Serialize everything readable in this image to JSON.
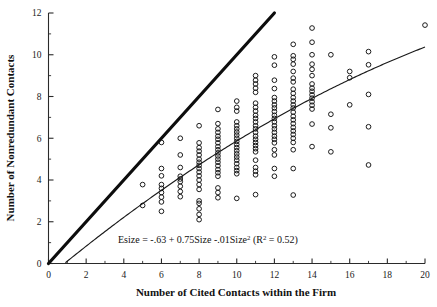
{
  "chart_data": {
    "type": "scatter",
    "title": "",
    "xlabel": "Number of Cited Contacts within the Firm",
    "ylabel": "Number of Nonredundant Contacts",
    "xlim": [
      0,
      20
    ],
    "ylim": [
      0,
      12
    ],
    "x_ticks": [
      0,
      2,
      4,
      6,
      8,
      10,
      12,
      14,
      16,
      18,
      20
    ],
    "y_ticks": [
      0,
      2,
      4,
      6,
      8,
      10,
      12
    ],
    "x_minor_ticks": [
      1,
      3,
      5,
      7,
      9,
      11,
      13,
      15,
      17,
      19
    ],
    "y_minor_ticks": [
      1,
      3,
      5,
      7,
      9,
      11
    ],
    "grid": false,
    "legend": "none",
    "annotation": "Esize =  -.63 + 0.75Size -.01Size²   (R² = 0.52)",
    "annotation_parts": {
      "lead": "Esize =  -.63 + 0.75Size -.01Size",
      "sup1": "2",
      "mid": "   (R",
      "sup2": "2",
      "tail": " = 0.52)"
    },
    "marker": "open-circle",
    "reference_line": {
      "name": "y = x identity line",
      "x": [
        0,
        12
      ],
      "y": [
        0,
        12
      ],
      "style": "thick-solid"
    },
    "fit_curve": {
      "name": "Esize = -.63 + 0.75*Size - .01*Size^2",
      "intercept": -0.63,
      "linear_coef": 0.75,
      "quadratic_coef": -0.01,
      "r_squared": 0.52,
      "x_start": 0.9,
      "x_end": 20,
      "style": "thin-solid"
    },
    "points": [
      [
        5,
        2.78
      ],
      [
        5,
        3.78
      ],
      [
        6,
        2.5
      ],
      [
        6,
        2.95
      ],
      [
        6,
        3.18
      ],
      [
        6,
        3.4
      ],
      [
        6,
        3.6
      ],
      [
        6,
        3.78
      ],
      [
        6,
        4.2
      ],
      [
        6,
        4.55
      ],
      [
        6,
        5.8
      ],
      [
        7,
        3.2
      ],
      [
        7,
        3.45
      ],
      [
        7,
        3.7
      ],
      [
        7,
        3.92
      ],
      [
        7,
        4.05
      ],
      [
        7,
        4.18
      ],
      [
        7,
        4.6
      ],
      [
        7,
        5.2
      ],
      [
        7,
        6.0
      ],
      [
        8,
        2.1
      ],
      [
        8,
        2.35
      ],
      [
        8,
        2.62
      ],
      [
        8,
        2.88
      ],
      [
        8,
        3.0
      ],
      [
        8,
        3.55
      ],
      [
        8,
        3.78
      ],
      [
        8,
        4.0
      ],
      [
        8,
        4.2
      ],
      [
        8,
        4.38
      ],
      [
        8,
        4.55
      ],
      [
        8,
        4.7
      ],
      [
        8,
        4.85
      ],
      [
        8,
        5.0
      ],
      [
        8,
        5.2
      ],
      [
        8,
        5.38
      ],
      [
        8,
        5.55
      ],
      [
        8,
        5.78
      ],
      [
        8,
        6.6
      ],
      [
        9,
        3.15
      ],
      [
        9,
        3.4
      ],
      [
        9,
        3.62
      ],
      [
        9,
        4.18
      ],
      [
        9,
        4.35
      ],
      [
        9,
        4.5
      ],
      [
        9,
        4.68
      ],
      [
        9,
        4.85
      ],
      [
        9,
        5.0
      ],
      [
        9,
        5.15
      ],
      [
        9,
        5.3
      ],
      [
        9,
        5.45
      ],
      [
        9,
        5.6
      ],
      [
        9,
        5.78
      ],
      [
        9,
        5.95
      ],
      [
        9,
        6.1
      ],
      [
        9,
        6.28
      ],
      [
        9,
        6.45
      ],
      [
        9,
        6.7
      ],
      [
        9,
        7.38
      ],
      [
        10,
        3.12
      ],
      [
        10,
        4.3
      ],
      [
        10,
        4.45
      ],
      [
        10,
        4.6
      ],
      [
        10,
        4.78
      ],
      [
        10,
        4.95
      ],
      [
        10,
        5.1
      ],
      [
        10,
        5.25
      ],
      [
        10,
        5.4
      ],
      [
        10,
        5.55
      ],
      [
        10,
        5.7
      ],
      [
        10,
        5.85
      ],
      [
        10,
        6.0
      ],
      [
        10,
        6.15
      ],
      [
        10,
        6.3
      ],
      [
        10,
        6.45
      ],
      [
        10,
        6.6
      ],
      [
        10,
        6.78
      ],
      [
        10,
        7.3
      ],
      [
        10,
        7.48
      ],
      [
        10,
        7.78
      ],
      [
        11,
        3.3
      ],
      [
        11,
        4.25
      ],
      [
        11,
        4.42
      ],
      [
        11,
        4.6
      ],
      [
        11,
        4.95
      ],
      [
        11,
        5.35
      ],
      [
        11,
        5.5
      ],
      [
        11,
        5.65
      ],
      [
        11,
        5.8
      ],
      [
        11,
        5.95
      ],
      [
        11,
        6.1
      ],
      [
        11,
        6.28
      ],
      [
        11,
        6.45
      ],
      [
        11,
        6.6
      ],
      [
        11,
        6.78
      ],
      [
        11,
        6.95
      ],
      [
        11,
        7.1
      ],
      [
        11,
        7.3
      ],
      [
        11,
        7.48
      ],
      [
        11,
        7.68
      ],
      [
        11,
        8.2
      ],
      [
        11,
        8.4
      ],
      [
        11,
        8.6
      ],
      [
        11,
        8.78
      ],
      [
        11,
        9.0
      ],
      [
        12,
        4.18
      ],
      [
        12,
        4.55
      ],
      [
        12,
        5.2
      ],
      [
        12,
        5.45
      ],
      [
        12,
        5.78
      ],
      [
        12,
        5.95
      ],
      [
        12,
        6.1
      ],
      [
        12,
        6.28
      ],
      [
        12,
        6.45
      ],
      [
        12,
        6.6
      ],
      [
        12,
        6.78
      ],
      [
        12,
        6.95
      ],
      [
        12,
        7.1
      ],
      [
        12,
        7.28
      ],
      [
        12,
        7.45
      ],
      [
        12,
        7.6
      ],
      [
        12,
        7.78
      ],
      [
        12,
        7.95
      ],
      [
        12,
        8.38
      ],
      [
        12,
        8.78
      ],
      [
        12,
        9.5
      ],
      [
        12,
        9.9
      ],
      [
        13,
        3.28
      ],
      [
        13,
        4.55
      ],
      [
        13,
        5.45
      ],
      [
        13,
        5.8
      ],
      [
        13,
        6.0
      ],
      [
        13,
        6.18
      ],
      [
        13,
        6.35
      ],
      [
        13,
        6.52
      ],
      [
        13,
        6.7
      ],
      [
        13,
        6.88
      ],
      [
        13,
        7.05
      ],
      [
        13,
        7.25
      ],
      [
        13,
        7.45
      ],
      [
        13,
        7.6
      ],
      [
        13,
        7.78
      ],
      [
        13,
        7.95
      ],
      [
        13,
        8.15
      ],
      [
        13,
        8.35
      ],
      [
        13,
        8.7
      ],
      [
        13,
        8.88
      ],
      [
        13,
        9.2
      ],
      [
        13,
        9.55
      ],
      [
        13,
        9.78
      ],
      [
        13,
        9.95
      ],
      [
        13,
        10.5
      ],
      [
        14,
        5.6
      ],
      [
        14,
        6.68
      ],
      [
        14,
        7.4
      ],
      [
        14,
        7.58
      ],
      [
        14,
        7.75
      ],
      [
        14,
        7.92
      ],
      [
        14,
        8.08
      ],
      [
        14,
        8.25
      ],
      [
        14,
        8.4
      ],
      [
        14,
        8.6
      ],
      [
        14,
        9.0
      ],
      [
        14,
        9.3
      ],
      [
        14,
        9.55
      ],
      [
        14,
        10.0
      ],
      [
        14,
        10.6
      ],
      [
        14,
        11.28
      ],
      [
        15,
        5.35
      ],
      [
        15,
        6.5
      ],
      [
        15,
        7.15
      ],
      [
        15,
        10.0
      ],
      [
        16,
        7.6
      ],
      [
        16,
        8.9
      ],
      [
        16,
        9.2
      ],
      [
        17,
        4.72
      ],
      [
        17,
        6.55
      ],
      [
        17,
        8.1
      ],
      [
        17,
        9.52
      ],
      [
        17,
        10.15
      ],
      [
        20,
        11.42
      ]
    ]
  }
}
